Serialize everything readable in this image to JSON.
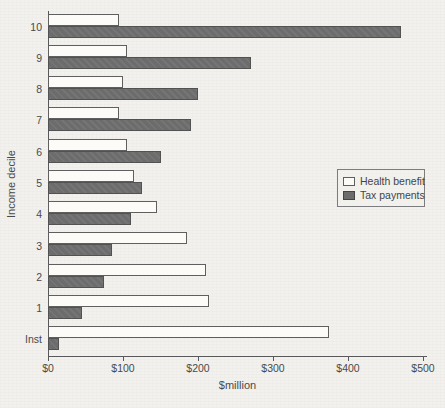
{
  "figure": {
    "background": "#f2f1ed",
    "bar_white": "#fcfbf8",
    "bar_gray": "#6c6c6c",
    "text_color": "#4a4a4a"
  },
  "chart_data": {
    "type": "bar",
    "orientation": "horizontal",
    "title": "",
    "xlabel": "$million",
    "ylabel": "Income decile",
    "categories": [
      "10",
      "9",
      "8",
      "7",
      "6",
      "5",
      "4",
      "3",
      "2",
      "1",
      "Inst"
    ],
    "series": [
      {
        "name": "Health benefit",
        "color": "#fcfbf8",
        "values": [
          95,
          105,
          100,
          95,
          105,
          115,
          145,
          185,
          210,
          215,
          375
        ]
      },
      {
        "name": "Tax payments",
        "color": "#6c6c6c",
        "values": [
          470,
          270,
          200,
          190,
          150,
          125,
          110,
          85,
          75,
          45,
          15
        ]
      }
    ],
    "xlim": [
      0,
      500
    ],
    "x_ticks": [
      {
        "value": 0,
        "label": "$0"
      },
      {
        "value": 100,
        "label": "$100"
      },
      {
        "value": 200,
        "label": "$200"
      },
      {
        "value": 300,
        "label": "$300"
      },
      {
        "value": 400,
        "label": "$400"
      },
      {
        "value": 500,
        "label": "$500"
      }
    ],
    "grid": false,
    "legend_position": "middle-right"
  }
}
